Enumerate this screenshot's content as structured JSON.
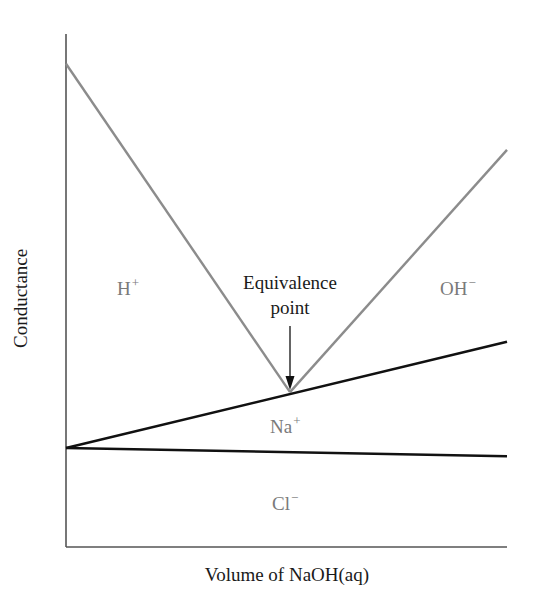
{
  "chart_data": {
    "type": "line",
    "title": "",
    "xlabel": "Volume of NaOH(aq)",
    "ylabel": "Conductance",
    "xlim": [
      0,
      100
    ],
    "ylim": [
      0,
      100
    ],
    "grid": false,
    "ticks": false,
    "series": [
      {
        "name": "H+",
        "color": "#8c8c8c",
        "points": [
          [
            0,
            94.2
          ],
          [
            50.8,
            30.2
          ]
        ]
      },
      {
        "name": "OH-",
        "color": "#8c8c8c",
        "points": [
          [
            50.8,
            30.2
          ],
          [
            100,
            77.4
          ]
        ]
      },
      {
        "name": "Na+",
        "color": "#111111",
        "points": [
          [
            0,
            19.3
          ],
          [
            100,
            40.0
          ]
        ]
      },
      {
        "name": "Cl-",
        "color": "#111111",
        "points": [
          [
            0,
            19.3
          ],
          [
            100,
            17.7
          ]
        ]
      }
    ],
    "region_labels": [
      {
        "text": "H",
        "sup": "+",
        "x": 14.5,
        "y": 51
      },
      {
        "text": "OH",
        "sup": "−",
        "x": 89,
        "y": 51
      },
      {
        "text": "Na",
        "sup": "+",
        "x": 50.8,
        "y": 23
      },
      {
        "text": "Cl",
        "sup": "−",
        "x": 50.8,
        "y": 8
      }
    ],
    "annotations": [
      {
        "text": "Equivalence point",
        "x": 50.8,
        "y": 30.2,
        "arrow": true
      }
    ]
  },
  "labels": {
    "xlabel": "Volume of NaOH(aq)",
    "ylabel": "Conductance",
    "annotation_line1": "Equivalence",
    "annotation_line2": "point",
    "h_ion": "H",
    "h_charge": "+",
    "oh_ion": "OH",
    "oh_charge": "−",
    "na_ion": "Na",
    "na_charge": "+",
    "cl_ion": "Cl",
    "cl_charge": "−"
  },
  "colors": {
    "gray_line": "#8c8c8c",
    "black_line": "#111111",
    "axis": "#555555",
    "ion_text": "#7a7a7a"
  }
}
